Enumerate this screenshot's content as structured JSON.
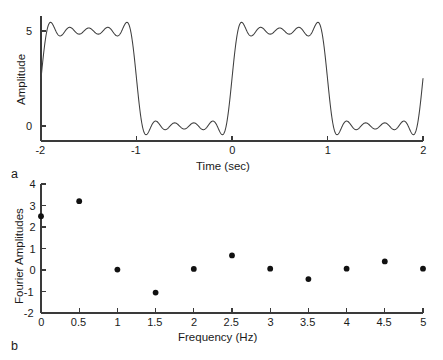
{
  "figure": {
    "panel_a_label": "a",
    "panel_b_label": "b",
    "line_color": "#3f3f3f",
    "dot_color": "#111111",
    "axis_color": "#3a3a3a",
    "background": "#ffffff"
  },
  "chart_data": [
    {
      "type": "line",
      "panel": "a",
      "title": "",
      "xlabel": "Time (sec)",
      "ylabel": "Amplitude",
      "xlim": [
        -2,
        2
      ],
      "ylim": [
        -1.15,
        6.2
      ],
      "xticks": [
        -2,
        -1,
        0,
        1,
        2
      ],
      "xticklabels": [
        "-2",
        "-1",
        "0",
        "1",
        "2"
      ],
      "yticks": [
        0,
        5
      ],
      "yticklabels": [
        "0",
        "5"
      ],
      "grid": false,
      "legend": "none",
      "description": "Truncated Fourier series approximation of a square wave showing Gibbs ringing",
      "series": [
        {
          "name": "Truncated Fourier square wave",
          "waveform": "square_partial_sum",
          "offset": 2.5,
          "amplitude": 2.5,
          "fundamental_hz": 0.5,
          "harmonics": [
            1,
            3,
            5,
            7,
            9
          ],
          "high_level": 5,
          "low_level": 0,
          "period_sec": 2,
          "duty_cycle": 0.5,
          "transition_times": [
            -1.5,
            -0.5,
            0.5,
            1.5
          ],
          "overshoot_high": 5.55,
          "undershoot_low": -0.55
        }
      ]
    },
    {
      "type": "scatter",
      "panel": "b",
      "title": "",
      "xlabel": "Frequency (Hz)",
      "ylabel": "Fourier Amplitudes",
      "xlim": [
        0,
        5
      ],
      "ylim": [
        -2,
        4
      ],
      "xticks": [
        0,
        0.5,
        1,
        1.5,
        2,
        2.5,
        3,
        3.5,
        4,
        4.5,
        5
      ],
      "xticklabels": [
        "0",
        "0.5",
        "1",
        "1.5",
        "2",
        "2.5",
        "3",
        "3.5",
        "4",
        "4.5",
        "5"
      ],
      "yticks": [
        -2,
        -1,
        0,
        1,
        2,
        3,
        4
      ],
      "yticklabels": [
        "-2",
        "-1",
        "0",
        "1",
        "2",
        "3",
        "4"
      ],
      "grid": false,
      "legend": "none",
      "description": "Fourier amplitude coefficients of the truncated square wave in panel a",
      "x": [
        0,
        0.5,
        1,
        1.5,
        2,
        2.5,
        3,
        3.5,
        4,
        4.5,
        5
      ],
      "values": [
        2.5,
        3.2,
        0.02,
        -1.05,
        0.05,
        0.68,
        0.06,
        -0.42,
        0.06,
        0.4,
        0.06
      ]
    }
  ]
}
